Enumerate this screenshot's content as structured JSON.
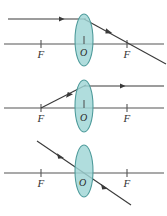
{
  "figure": {
    "width": 167,
    "height": 216,
    "background": "#ffffff",
    "colors": {
      "lens_fill": "#9fd5d5",
      "lens_stroke": "#4e9b9b",
      "line": "#555555",
      "ray": "#3a3a3a",
      "label": "#333333"
    }
  },
  "panels": [
    {
      "id": "panel-1",
      "name": "parallel-ray-through-focus",
      "axis_y": 44,
      "lens": {
        "cx": 84,
        "cy": 40,
        "rx": 9,
        "ry": 26
      },
      "focus_left": {
        "x": 41,
        "label": "F"
      },
      "focus_right": {
        "x": 127,
        "label": "F"
      },
      "center_label": "O",
      "incident_ray": {
        "x1": 8,
        "y1": 19,
        "x2": 84,
        "y2": 19,
        "arrow_at": {
          "x": 62,
          "y": 19
        },
        "description": "parallel ray arriving along axis-parallel path"
      },
      "refracted_ray": {
        "x1": 84,
        "y1": 19,
        "x2": 166,
        "y2": 64,
        "arrow_at": {
          "x": 110,
          "y": 33
        },
        "description": "refracted through right focal point F"
      }
    },
    {
      "id": "panel-2",
      "name": "ray-through-focus-exits-parallel",
      "axis_y": 108,
      "lens": {
        "cx": 84,
        "cy": 106,
        "rx": 9,
        "ry": 26
      },
      "focus_left": {
        "x": 41,
        "label": "F"
      },
      "focus_right": {
        "x": 127,
        "label": "F"
      },
      "center_label": "O",
      "incident_ray": {
        "x1": 41,
        "y1": 108,
        "x2": 84,
        "y2": 86,
        "arrow_at": {
          "x": 70,
          "y": 93
        },
        "description": "ray from left focal point F toward lens"
      },
      "refracted_ray": {
        "x1": 84,
        "y1": 86,
        "x2": 164,
        "y2": 86,
        "arrow_at": {
          "x": 124,
          "y": 86
        },
        "description": "exits parallel to principal axis"
      }
    },
    {
      "id": "panel-3",
      "name": "ray-through-optical-centre",
      "axis_y": 173,
      "lens": {
        "cx": 84,
        "cy": 171,
        "rx": 9,
        "ry": 26
      },
      "focus_left": {
        "x": 41,
        "label": "F"
      },
      "focus_right": {
        "x": 127,
        "label": "F"
      },
      "center_label": "O",
      "incident_ray": {
        "x1": 38,
        "y1": 142,
        "x2": 84,
        "y2": 173,
        "arrow_at": {
          "x": 62,
          "y": 158
        },
        "description": "oblique ray aimed at optical centre O"
      },
      "refracted_ray": {
        "x1": 84,
        "y1": 173,
        "x2": 130,
        "y2": 204,
        "arrow_at": {
          "x": 106,
          "y": 188
        },
        "description": "passes straight through undeviated"
      }
    }
  ],
  "axis_extent": {
    "x_start": 4,
    "x_end": 164
  },
  "tick": {
    "half_height": 4
  }
}
